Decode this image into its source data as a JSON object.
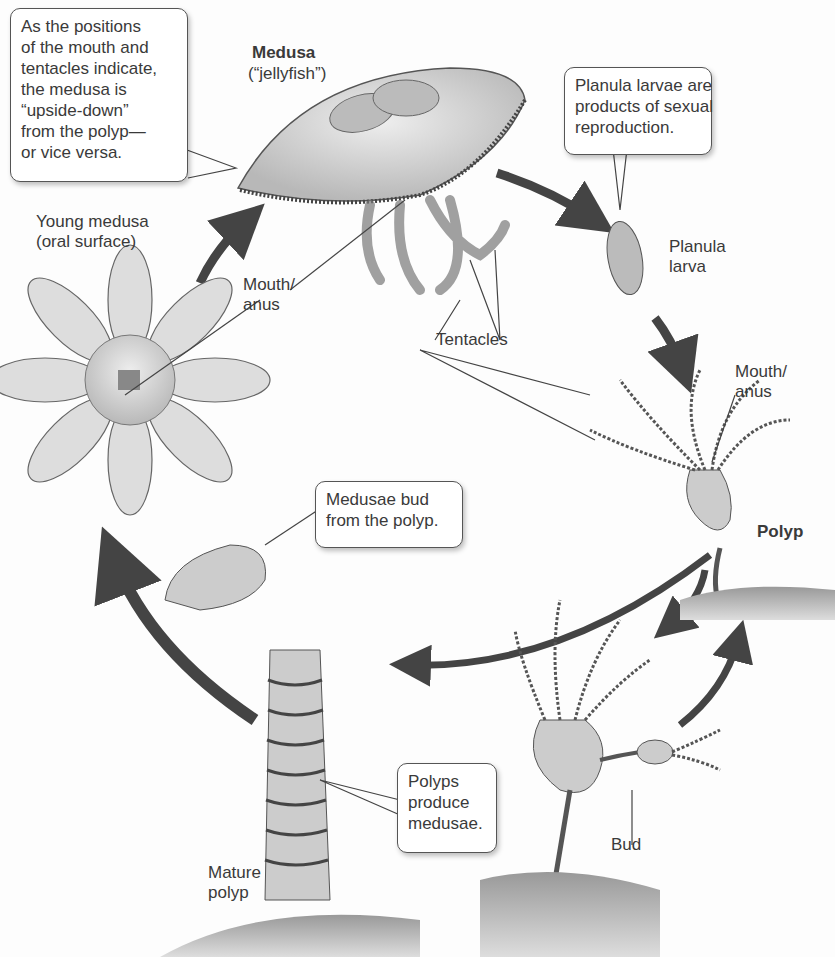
{
  "stages": {
    "medusa": {
      "name": "Medusa",
      "subtitle": "(“jellyfish”)"
    },
    "planula": {
      "name": "Planula\nlarva"
    },
    "polyp": {
      "name": "Polyp"
    },
    "mature_polyp": {
      "name": "Mature\npolyp"
    },
    "young_medusa": {
      "name": "Young medusa\n(oral surface)"
    }
  },
  "labels": {
    "mouth_anus_medusa": "Mouth/\nanus",
    "mouth_anus_polyp": "Mouth/\nanus",
    "tentacles": "Tentacles",
    "bud": "Bud"
  },
  "callouts": {
    "upside_down": "As the positions\nof the mouth and\ntentacles indicate,\nthe medusa is\n“upside-down”\nfrom the polyp—\nor vice versa.",
    "planula": "Planula larvae are\nproducts of sexual\nreproduction.",
    "medusae_bud": "Medusae bud\nfrom the polyp.",
    "polyps_produce": "Polyps\nproduce\nmedusae."
  },
  "colors": {
    "arrow": "#444444",
    "organism_fill": "#d9d9d9",
    "organism_stroke": "#555555",
    "ground": "#8a8a8a"
  }
}
